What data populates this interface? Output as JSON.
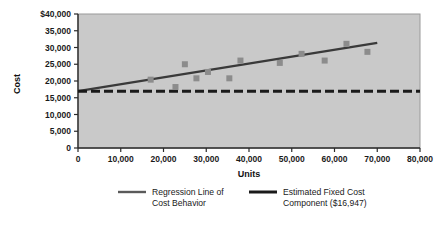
{
  "chart_data": {
    "type": "scatter",
    "title": "",
    "xlabel": "Units",
    "ylabel": "Cost",
    "xlim": [
      0,
      80000
    ],
    "ylim": [
      0,
      40000
    ],
    "grid": false,
    "legend_position": "bottom",
    "x_tick_labels": [
      "0",
      "10,000",
      "20,000",
      "30,000",
      "40,000",
      "50,000",
      "60,000",
      "70,000",
      "80,000"
    ],
    "x_tick_values": [
      0,
      10000,
      20000,
      30000,
      40000,
      50000,
      60000,
      70000,
      80000
    ],
    "y_tick_labels": [
      "$40,000",
      "35,000",
      "30,000",
      "25,000",
      "20,000",
      "15,000",
      "10,000",
      "5,000",
      "0"
    ],
    "y_tick_values": [
      40000,
      35000,
      30000,
      25000,
      20000,
      15000,
      10000,
      5000,
      0
    ],
    "series": [
      {
        "name": "Observed Cost Points",
        "type": "scatter",
        "marker": "square",
        "color": "#8c8c8c",
        "points": [
          {
            "x": 17000,
            "y": 20400
          },
          {
            "x": 22800,
            "y": 18200
          },
          {
            "x": 25000,
            "y": 25000
          },
          {
            "x": 27700,
            "y": 20800
          },
          {
            "x": 30400,
            "y": 22700
          },
          {
            "x": 35400,
            "y": 20800
          },
          {
            "x": 38000,
            "y": 26100
          },
          {
            "x": 47200,
            "y": 25400
          },
          {
            "x": 52300,
            "y": 28100
          },
          {
            "x": 57700,
            "y": 26100
          },
          {
            "x": 62800,
            "y": 31100
          },
          {
            "x": 67700,
            "y": 28700
          }
        ]
      },
      {
        "name": "Regression Line of Cost Behavior",
        "type": "line",
        "color": "#3a3a3a",
        "points": [
          {
            "x": 0,
            "y": 17000
          },
          {
            "x": 70000,
            "y": 31400
          }
        ]
      },
      {
        "name": "Estimated Fixed Cost Component ($16,947)",
        "type": "line",
        "style": "dashed",
        "color": "#1a1a1a",
        "value": 16947,
        "points": [
          {
            "x": 0,
            "y": 16947
          },
          {
            "x": 80000,
            "y": 16947
          }
        ]
      }
    ]
  },
  "axes": {
    "y_title": "Cost",
    "x_title": "Units"
  },
  "legend": {
    "items": [
      {
        "swatch": "regression-line-swatch",
        "line1": "Regression Line of",
        "line2": "Cost Behavior",
        "color": "#5a5a5a"
      },
      {
        "swatch": "fixed-cost-line-swatch",
        "line1": "Estimated Fixed Cost",
        "line2": "Component ($16,947)",
        "color": "#1a1a1a"
      }
    ]
  },
  "colors": {
    "plot_background": "#c9c9c9",
    "marker": "#8c8c8c",
    "regression_line": "#3a3a3a",
    "fixed_cost_line": "#141414",
    "axis": "#2b2b2b",
    "text": "#1a1a1a"
  }
}
